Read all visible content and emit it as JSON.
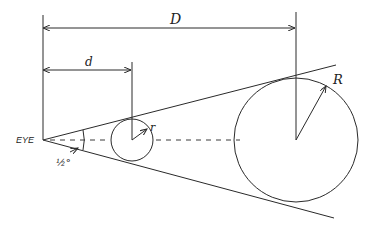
{
  "diagram": {
    "labels": {
      "eye": "EYE",
      "far_distance": "D",
      "near_distance": "d",
      "far_radius": "R",
      "near_radius": "r",
      "angle": "½°"
    },
    "elements": [
      "eye vertex",
      "cone of vision (two tangent lines)",
      "small near circle radius r at distance d",
      "large far circle radius R at distance D",
      "dashed line of sight through centers"
    ],
    "line_color": "#2a2a2a"
  }
}
